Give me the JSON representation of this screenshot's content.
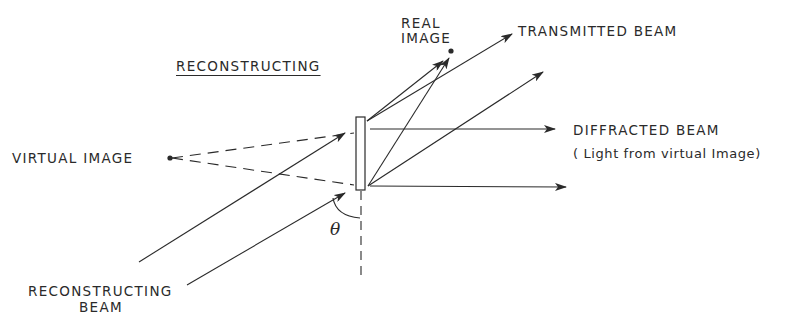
{
  "diagram": {
    "title": "RECONSTRUCTING",
    "labels": {
      "real_image_line1": "REAL",
      "real_image_line2": "IMAGE",
      "transmitted_beam": "TRANSMITTED  BEAM",
      "diffracted_beam": "DIFFRACTED BEAM",
      "diffracted_beam_note": "( Light from virtual Image)",
      "virtual_image": "VIRTUAL  IMAGE",
      "reconstructing_beam_line1": "RECONSTRUCTING",
      "reconstructing_beam_line2": "BEAM",
      "angle_symbol": "θ"
    },
    "elements": {
      "hologram_plate": "hologram",
      "virtual_image_point": "point",
      "real_image_point": "point"
    },
    "colors": {
      "ink": "#2a2a2a",
      "background": "#ffffff"
    }
  }
}
